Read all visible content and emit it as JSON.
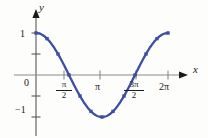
{
  "figure": {
    "background_color": "#fdfdfb",
    "curve_color": "#3f4fa0",
    "axis_color": "#595959",
    "text_color": "#1a1a1a",
    "axes": {
      "x_axis_label": "x",
      "y_axis_label": "y",
      "x_ticks": [
        {
          "label": "π/2",
          "numerator": "π",
          "denominator": "2",
          "value": 1.5708,
          "is_fraction": true
        },
        {
          "label": "π",
          "value": 3.1416,
          "is_fraction": false
        },
        {
          "label": "3π/2",
          "numerator": "3π",
          "denominator": "2",
          "value": 4.7124,
          "is_fraction": true
        },
        {
          "label": "2π",
          "value": 6.2832,
          "is_fraction": false
        }
      ],
      "y_ticks": [
        {
          "label": "1",
          "value": 1
        },
        {
          "label": "0",
          "value": 0
        },
        {
          "label": "−1",
          "value": -1
        }
      ]
    }
  },
  "chart_data": {
    "type": "line",
    "title": "",
    "xlabel": "x",
    "ylabel": "y",
    "xlim": [
      0,
      6.2832
    ],
    "ylim": [
      -1,
      1
    ],
    "grid": false,
    "legend": "none",
    "marker": "square",
    "marker_color": "#3f4fa0",
    "line_color": "#3f4fa0",
    "function": "y = cos(x)",
    "xtick_values": [
      1.5708,
      3.1416,
      4.7124,
      6.2832
    ],
    "xtick_labels": [
      "π/2",
      "π",
      "3π/2",
      "2π"
    ],
    "ytick_values": [
      1,
      0,
      -1
    ],
    "ytick_labels": [
      "1",
      "0",
      "−1"
    ],
    "x": [
      0,
      0.5236,
      1.0472,
      1.5708,
      2.0944,
      2.618,
      3.1416,
      3.6652,
      4.1888,
      4.7124,
      5.236,
      5.7596,
      6.2832
    ],
    "y": [
      1,
      0.866,
      0.5,
      0,
      -0.5,
      -0.866,
      -1,
      -0.866,
      -0.5,
      0,
      0.5,
      0.866,
      1
    ],
    "series": [
      {
        "name": "cos(x)",
        "values": [
          1,
          0.866,
          0.5,
          0,
          -0.5,
          -0.866,
          -1,
          -0.866,
          -0.5,
          0,
          0.5,
          0.866,
          1
        ]
      }
    ]
  }
}
